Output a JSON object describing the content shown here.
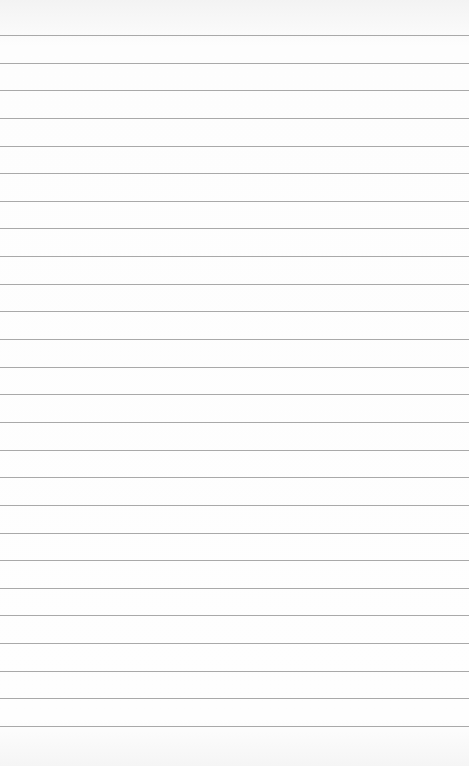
{
  "paper": {
    "type": "lined-notebook-paper",
    "line_color": "#a9a9a9",
    "background_color": "#fdfdfd",
    "first_line_y": 35,
    "line_spacing": 27.64,
    "line_count": 26
  }
}
